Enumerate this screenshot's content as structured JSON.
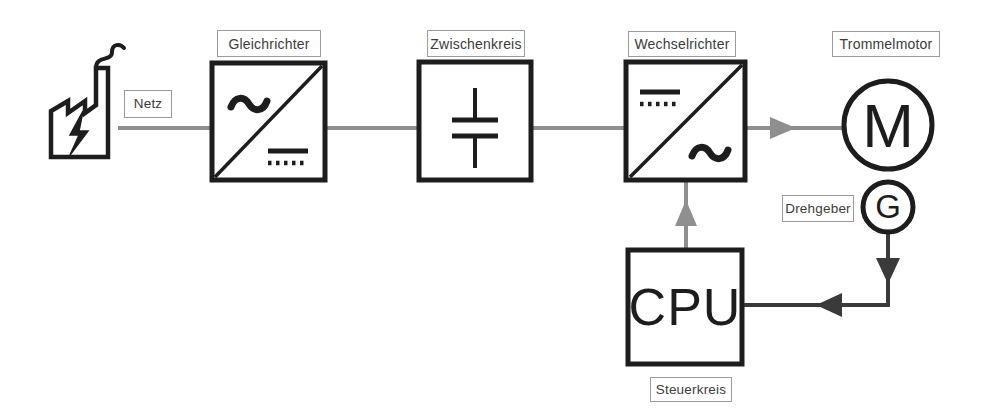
{
  "diagram": {
    "colors": {
      "stroke_dark": "#1d1d1d",
      "stroke_mid": "#3a3a3a",
      "wire_gray": "#8f8f8f",
      "label_border": "#9b9b9b",
      "label_text": "#3c3c3c",
      "background": "#ffffff"
    },
    "labels": {
      "netz": "Netz",
      "gleichrichter": "Gleichrichter",
      "zwischenkreis": "Zwischenkreis",
      "wechselrichter": "Wechselrichter",
      "trommelmotor": "Trommelmotor",
      "drehgeber": "Drehgeber",
      "steuerkreis": "Steuerkreis"
    },
    "blocks": {
      "motor_symbol": "M",
      "generator_symbol": "G",
      "cpu_symbol": "CPU"
    },
    "symbols": {
      "factory": "factory-icon",
      "lightning": "lightning-bolt-icon",
      "ac_wave": "ac-tilde-symbol",
      "dc_lines": "dc-line-dotted-symbol",
      "capacitor": "capacitor-symbol",
      "diagonal": "diagonal-divider"
    },
    "connections": [
      {
        "from": "netz",
        "to": "gleichrichter",
        "style": "gray-line"
      },
      {
        "from": "gleichrichter",
        "to": "zwischenkreis",
        "style": "gray-line"
      },
      {
        "from": "zwischenkreis",
        "to": "wechselrichter",
        "style": "gray-line"
      },
      {
        "from": "wechselrichter",
        "to": "trommelmotor",
        "style": "gray-arrow"
      },
      {
        "from": "cpu",
        "to": "wechselrichter",
        "style": "gray-arrow-up"
      },
      {
        "from": "drehgeber",
        "to": "cpu",
        "style": "dark-arrow-feedback"
      }
    ]
  }
}
